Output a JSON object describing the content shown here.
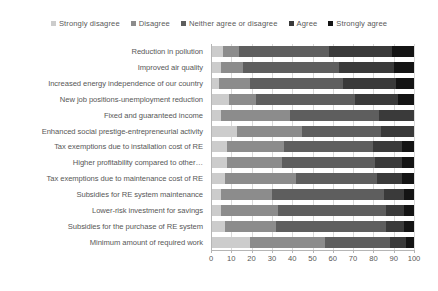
{
  "chart_data": {
    "type": "bar",
    "orientation": "horizontal",
    "stacked": true,
    "stack_mode": "percent",
    "title": "",
    "xlabel": "",
    "ylabel": "",
    "xlim": [
      0,
      100
    ],
    "xticks": [
      0,
      10,
      20,
      30,
      40,
      50,
      60,
      70,
      80,
      90,
      100
    ],
    "grid": true,
    "legend_position": "top",
    "legend": [
      "Strongly disagree",
      "Disagree",
      "Neither agree or disagree",
      "Agree",
      "Strongly agree"
    ],
    "colors": [
      "#cccccc",
      "#8c8c8c",
      "#5e5e5e",
      "#3a3a3a",
      "#141414"
    ],
    "categories": [
      "Reduction in pollution",
      "Improved air quality",
      "Increased energy independence of our country",
      "New job positions-unemployment reduction",
      "Fixed and guaranteed income",
      "Enhanced social prestige-entrepreneurial activity",
      "Tax exemptions due to installation cost of RE",
      "Higher profitability compared to other…",
      "Tax exemptions due to maintenance cost of RE",
      "Subsidies for RE system maintenance",
      "Lower-risk investment for savings",
      "Subsidies for the purchase of RE system",
      "Minimum amount of required work"
    ],
    "series": [
      {
        "name": "Strongly disagree",
        "values": [
          6,
          5,
          4,
          9,
          5,
          13,
          8,
          8,
          7,
          5,
          5,
          7,
          19
        ]
      },
      {
        "name": "Disagree",
        "values": [
          8,
          11,
          15,
          13,
          34,
          32,
          28,
          27,
          35,
          25,
          28,
          25,
          37
        ]
      },
      {
        "name": "Neither agree or disagree",
        "values": [
          44,
          47,
          46,
          49,
          44,
          39,
          44,
          46,
          40,
          55,
          53,
          54,
          32
        ]
      },
      {
        "name": "Agree",
        "values": [
          31,
          27,
          26,
          21,
          17,
          16,
          14,
          13,
          12,
          10,
          9,
          9,
          8
        ]
      },
      {
        "name": "Strongly agree",
        "values": [
          11,
          10,
          9,
          8,
          0,
          0,
          6,
          6,
          6,
          5,
          5,
          5,
          4
        ]
      }
    ]
  },
  "legend": {
    "items": [
      {
        "label": "Strongly disagree",
        "color": "#cccccc"
      },
      {
        "label": "Disagree",
        "color": "#8c8c8c"
      },
      {
        "label": "Neither agree or disagree",
        "color": "#5e5e5e"
      },
      {
        "label": "Agree",
        "color": "#3a3a3a"
      },
      {
        "label": "Strongly agree",
        "color": "#141414"
      }
    ]
  },
  "xaxis": {
    "ticks": [
      "0",
      "10",
      "20",
      "30",
      "40",
      "50",
      "60",
      "70",
      "80",
      "90",
      "100"
    ]
  }
}
